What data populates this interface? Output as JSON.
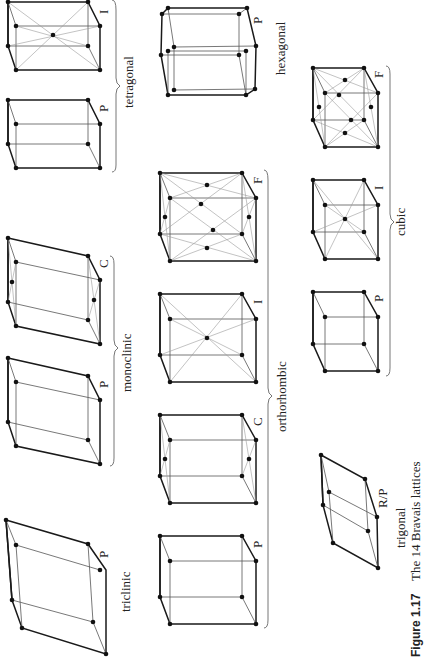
{
  "figure": {
    "caption_number": "Figure 1.17",
    "caption_text": "The 14 Bravais lattices",
    "orientation": "rotated 90° (text reads bottom-to-top)"
  },
  "crystal_systems": [
    {
      "name": "triclinic",
      "lattices": [
        {
          "type": "P"
        }
      ]
    },
    {
      "name": "monoclinic",
      "lattices": [
        {
          "type": "P"
        },
        {
          "type": "C"
        }
      ]
    },
    {
      "name": "orthorhombic",
      "lattices": [
        {
          "type": "P"
        },
        {
          "type": "C"
        },
        {
          "type": "I"
        },
        {
          "type": "F"
        }
      ]
    },
    {
      "name": "tetragonal",
      "lattices": [
        {
          "type": "P"
        },
        {
          "type": "I"
        }
      ]
    },
    {
      "name": "trigonal",
      "lattices": [
        {
          "type": "R/P"
        }
      ]
    },
    {
      "name": "hexagonal",
      "lattices": [
        {
          "type": "P"
        }
      ]
    },
    {
      "name": "cubic",
      "lattices": [
        {
          "type": "P"
        },
        {
          "type": "I"
        },
        {
          "type": "F"
        }
      ]
    }
  ],
  "labels": {
    "triclinic": "triclinic",
    "monoclinic": "monoclinic",
    "orthorhombic": "orthorhombic",
    "tetragonal": "tetragonal",
    "trigonal": "trigonal",
    "hexagonal": "hexagonal",
    "cubic": "cubic",
    "tri_P": "P",
    "mono_P": "P",
    "mono_C": "C",
    "ortho_P": "P",
    "ortho_C": "C",
    "ortho_I": "I",
    "ortho_F": "F",
    "tet_P": "P",
    "tet_I": "I",
    "trig_RP": "R/P",
    "hex_P": "P",
    "cub_P": "P",
    "cub_I": "I",
    "cub_F": "F"
  }
}
